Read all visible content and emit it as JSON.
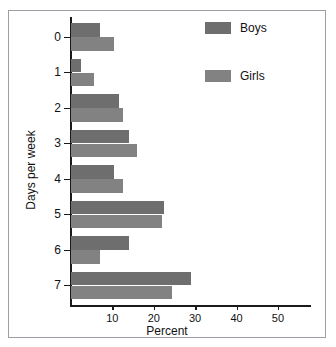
{
  "chart_data": {
    "type": "bar",
    "orientation": "horizontal",
    "title": "",
    "xlabel": "Percent",
    "ylabel": "Days per week",
    "categories": [
      "0",
      "1",
      "2",
      "3",
      "4",
      "5",
      "6",
      "7"
    ],
    "series": [
      {
        "name": "Boys",
        "color": "#6e6e6e",
        "values": [
          7,
          2.5,
          11.5,
          14,
          10.5,
          22.5,
          14,
          29
        ]
      },
      {
        "name": "Girls",
        "color": "#828282",
        "values": [
          10.5,
          5.5,
          12.5,
          16,
          12.5,
          22,
          7,
          24.5
        ]
      }
    ],
    "xlim": [
      0,
      58
    ],
    "xticks": [
      10,
      20,
      30,
      40,
      50
    ],
    "xtick_labels": [
      "10",
      "20",
      "30",
      "40",
      "50"
    ],
    "grid": false,
    "legend_position": "top-right"
  },
  "legend": {
    "entries": [
      {
        "label": "Boys",
        "color": "#6e6e6e"
      },
      {
        "label": "Girls",
        "color": "#828282"
      }
    ]
  },
  "axes": {
    "x_title": "Percent",
    "y_title": "Days per week"
  }
}
